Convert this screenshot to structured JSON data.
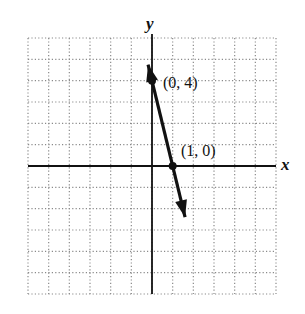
{
  "chart_data": {
    "type": "line",
    "title": "",
    "xlabel": "x",
    "ylabel": "y",
    "xlim": [
      -6,
      6
    ],
    "ylim": [
      -6,
      6
    ],
    "grid": true,
    "grid_style": "dotted",
    "tick_labels": "none",
    "series": [
      {
        "name": "y = -4x + 4",
        "equation": "y = -4x + 4",
        "slope": -4,
        "intercept": 4,
        "arrows": "both",
        "x": [
          -0.19,
          1.6
        ],
        "y": [
          4.75,
          -2.4
        ]
      }
    ],
    "points": [
      {
        "x": 0,
        "y": 4,
        "label": "(0, 4)"
      },
      {
        "x": 1,
        "y": 0,
        "label": "(1, 0)"
      }
    ]
  },
  "labels": {
    "x_axis": "x",
    "y_axis": "y",
    "point_a": "(0, 4)",
    "point_b": "(1, 0)"
  },
  "colors": {
    "line": "#111111",
    "grid": "#8a8a8a",
    "axes": "#111111"
  }
}
